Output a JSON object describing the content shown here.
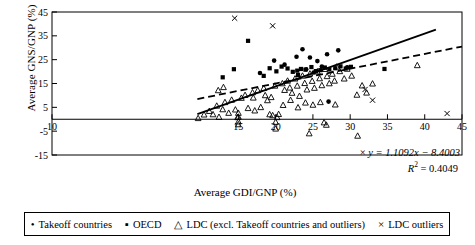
{
  "chart_data": {
    "type": "scatter",
    "title": "",
    "xlabel": "Average GDI/GNP (%)",
    "ylabel": "Average GNS/GNP (%)",
    "xlim": [
      -10,
      45
    ],
    "ylim": [
      -15,
      45
    ],
    "xticks": [
      -10,
      15,
      20,
      25,
      30,
      35,
      40,
      45
    ],
    "xtick_labels": [
      "10",
      "15",
      "20",
      "25",
      "30",
      "35",
      "40",
      "45"
    ],
    "yticks": [
      45,
      35,
      25,
      15,
      5,
      -5,
      -15
    ],
    "ytick_labels": [
      "45",
      "35",
      "25",
      "15",
      "5",
      "-5",
      "-15"
    ],
    "grid": false,
    "legend_position": "bottom",
    "annotations": {
      "equation": "y = 1.1092x − 8.4003",
      "r_squared_label": "R",
      "r_squared_exp": "2",
      "r_squared_value": " = 0.4049",
      "marker": "×"
    },
    "trendlines": [
      {
        "name": "solid-regression",
        "style": "solid",
        "slope": 1.1092,
        "intercept": -8.4003,
        "x_start": 9.5,
        "x_end": 41.5
      },
      {
        "name": "dashed-reference",
        "style": "dashed",
        "slope": 0.62,
        "intercept": 2.6,
        "x_start": 9.5,
        "x_end": 45.0
      }
    ],
    "series": [
      {
        "name": "Takeoff countries",
        "marker": "circle",
        "points": [
          [
            19.8,
            24.6
          ],
          [
            21.2,
            22.9
          ],
          [
            22.8,
            26.2
          ],
          [
            23.6,
            29.4
          ],
          [
            24.6,
            25.9
          ],
          [
            25.6,
            24.4
          ],
          [
            26.2,
            22.1
          ],
          [
            26.9,
            27.3
          ],
          [
            28.4,
            28.9
          ],
          [
            27.1,
            7.4
          ],
          [
            17.9,
            19.4
          ],
          [
            24.1,
            21.0
          ],
          [
            29.6,
            21.8
          ],
          [
            25.1,
            19.6
          ]
        ]
      },
      {
        "name": "OECD",
        "marker": "square",
        "points": [
          [
            16.3,
            32.9
          ],
          [
            14.4,
            21.0
          ],
          [
            19.2,
            21.4
          ],
          [
            20.1,
            20.1
          ],
          [
            20.8,
            22.1
          ],
          [
            21.6,
            21.3
          ],
          [
            22.3,
            19.9
          ],
          [
            22.9,
            20.4
          ],
          [
            23.4,
            21.1
          ],
          [
            24.0,
            20.8
          ],
          [
            24.8,
            21.9
          ],
          [
            25.4,
            20.2
          ],
          [
            26.0,
            20.6
          ],
          [
            26.6,
            21.7
          ],
          [
            27.2,
            20.9
          ],
          [
            28.0,
            21.4
          ],
          [
            28.7,
            22.2
          ],
          [
            29.4,
            21.3
          ],
          [
            30.1,
            22.0
          ],
          [
            34.6,
            21.1
          ],
          [
            12.9,
            17.6
          ],
          [
            18.4,
            18.2
          ],
          [
            23.0,
            18.6
          ]
        ]
      },
      {
        "name": "LDC (excl. Takeoff countries and outliers)",
        "marker": "triangle",
        "points": [
          [
            9.6,
            0.4
          ],
          [
            10.4,
            1.9
          ],
          [
            11.1,
            3.4
          ],
          [
            11.6,
            2.0
          ],
          [
            12.1,
            5.6
          ],
          [
            12.4,
            0.9
          ],
          [
            12.9,
            4.1
          ],
          [
            13.2,
            7.1
          ],
          [
            13.7,
            2.6
          ],
          [
            14.1,
            8.1
          ],
          [
            14.6,
            4.0
          ],
          [
            14.9,
            0.8
          ],
          [
            15.0,
            2.6
          ],
          [
            15.0,
            1.0
          ],
          [
            15.4,
            8.9
          ],
          [
            15.9,
            10.1
          ],
          [
            16.3,
            4.6
          ],
          [
            16.9,
            11.2
          ],
          [
            17.2,
            3.6
          ],
          [
            17.6,
            12.1
          ],
          [
            18.0,
            5.0
          ],
          [
            18.4,
            13.0
          ],
          [
            18.9,
            7.9
          ],
          [
            19.2,
            2.0
          ],
          [
            19.6,
            1.6
          ],
          [
            19.9,
            14.0
          ],
          [
            20.2,
            0.8
          ],
          [
            20.4,
            2.1
          ],
          [
            20.9,
            15.0
          ],
          [
            21.2,
            12.2
          ],
          [
            21.6,
            16.1
          ],
          [
            21.9,
            13.2
          ],
          [
            22.2,
            11.0
          ],
          [
            22.6,
            17.0
          ],
          [
            22.9,
            14.0
          ],
          [
            23.2,
            9.7
          ],
          [
            23.6,
            18.2
          ],
          [
            23.9,
            15.1
          ],
          [
            24.2,
            12.4
          ],
          [
            24.6,
            19.1
          ],
          [
            24.9,
            16.0
          ],
          [
            25.2,
            13.1
          ],
          [
            25.6,
            20.0
          ],
          [
            25.9,
            17.1
          ],
          [
            26.2,
            14.2
          ],
          [
            26.6,
            21.0
          ],
          [
            26.9,
            18.0
          ],
          [
            27.2,
            15.0
          ],
          [
            27.6,
            19.0
          ],
          [
            27.9,
            16.1
          ],
          [
            28.2,
            22.0
          ],
          [
            28.6,
            20.1
          ],
          [
            29.2,
            17.0
          ],
          [
            29.6,
            21.1
          ],
          [
            30.2,
            18.2
          ],
          [
            30.9,
            10.2
          ],
          [
            31.6,
            14.1
          ],
          [
            32.2,
            11.1
          ],
          [
            33.0,
            14.9
          ],
          [
            39.0,
            22.6
          ],
          [
            22.0,
            8.0
          ],
          [
            24.0,
            6.9
          ],
          [
            25.0,
            6.0
          ],
          [
            21.0,
            5.9
          ],
          [
            23.0,
            4.9
          ],
          [
            26.0,
            7.1
          ],
          [
            28.0,
            6.1
          ],
          [
            20.0,
            -4.0
          ],
          [
            24.5,
            -6.0
          ],
          [
            31.0,
            -7.0
          ],
          [
            15.0,
            -1.0
          ],
          [
            15.0,
            -2.2
          ],
          [
            20.0,
            -1.2
          ],
          [
            26.5,
            -1.4
          ],
          [
            26.8,
            -2.4
          ],
          [
            13.0,
            13.4
          ],
          [
            12.3,
            12.1
          ],
          [
            17.0,
            9.0
          ],
          [
            18.6,
            10.0
          ],
          [
            19.4,
            9.2
          ]
        ]
      },
      {
        "name": "LDC outliers",
        "marker": "cross",
        "points": [
          [
            14.5,
            42.4
          ],
          [
            19.6,
            39.2
          ],
          [
            32.0,
            12.5
          ],
          [
            43.0,
            2.4
          ],
          [
            33.0,
            8.0
          ]
        ]
      }
    ],
    "legend_entries": [
      {
        "label": "Takeoff countries",
        "glyph": "•",
        "marker": "circle"
      },
      {
        "label": "OECD",
        "glyph": "▪",
        "marker": "square"
      },
      {
        "label": "LDC (excl. Takeoff countries and outliers)",
        "glyph": "△",
        "marker": "triangle"
      },
      {
        "label": "LDC outliers",
        "glyph": "×",
        "marker": "cross"
      }
    ]
  }
}
